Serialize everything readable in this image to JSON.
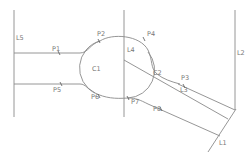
{
  "diagram": {
    "type": "cad-sketch",
    "colors": {
      "line": "#8a8a8a",
      "label": "#777777",
      "marker": "#555555",
      "background": "#ffffff"
    },
    "lines": [
      {
        "id": "L5",
        "label": "L5"
      },
      {
        "id": "L4",
        "label": "L4"
      },
      {
        "id": "L2",
        "label": "L2"
      },
      {
        "id": "L3",
        "label": "L3"
      },
      {
        "id": "L1",
        "label": "L1"
      }
    ],
    "arcs": [
      {
        "id": "C1",
        "label": "C1"
      },
      {
        "id": "C2",
        "label": "C2"
      }
    ],
    "points": [
      {
        "id": "P1",
        "label": "P1"
      },
      {
        "id": "P2",
        "label": "P2"
      },
      {
        "id": "P3",
        "label": "P3"
      },
      {
        "id": "P4",
        "label": "P4"
      },
      {
        "id": "P5",
        "label": "P5"
      },
      {
        "id": "P6",
        "label": "P6"
      },
      {
        "id": "P7",
        "label": "P7"
      },
      {
        "id": "P8",
        "label": "P8"
      }
    ]
  }
}
